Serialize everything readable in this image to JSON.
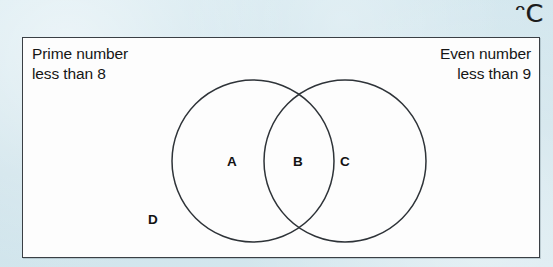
{
  "figure": {
    "type": "venn-diagram",
    "universal_set_symbol": "ᵔC",
    "sets": {
      "left": {
        "label": "Prime number\nless than 8"
      },
      "right": {
        "label": "Even number\nless than 9"
      }
    },
    "regions": [
      {
        "id": "A",
        "label": "A",
        "meaning": "left-set-only"
      },
      {
        "id": "B",
        "label": "B",
        "meaning": "intersection"
      },
      {
        "id": "C",
        "label": "C",
        "meaning": "right-set-only"
      },
      {
        "id": "D",
        "label": "D",
        "meaning": "outside-both-sets"
      }
    ],
    "colors": {
      "page_background": "#cfe4ec",
      "universe_fill": "#fdfdfd",
      "stroke": "#3a3f44",
      "circle_stroke": "#2e3338",
      "text": "#161616"
    },
    "geometry": {
      "universe_rect": {
        "x": 22,
        "y": 37,
        "width": 518,
        "height": 221
      },
      "circle_left": {
        "cx": 253,
        "cy": 161,
        "r": 81
      },
      "circle_right": {
        "cx": 345,
        "cy": 161,
        "r": 81
      }
    }
  }
}
